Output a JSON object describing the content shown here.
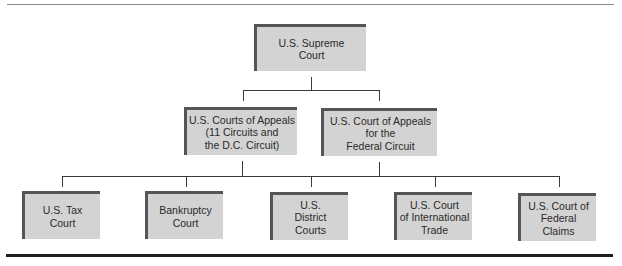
{
  "diagram": {
    "type": "hierarchy",
    "levels": [
      {
        "level": 1,
        "nodes": [
          {
            "id": "supreme",
            "label": "U.S. Supreme\nCourt"
          }
        ]
      },
      {
        "level": 2,
        "nodes": [
          {
            "id": "appeals",
            "label": "U.S. Courts of Appeals\n(11 Circuits and\nthe D.C. Circuit)",
            "parent": "supreme"
          },
          {
            "id": "federal_circuit",
            "label": "U.S. Court of Appeals\nfor the\nFederal Circuit",
            "parent": "supreme"
          }
        ]
      },
      {
        "level": 3,
        "nodes": [
          {
            "id": "tax",
            "label": "U.S. Tax\nCourt"
          },
          {
            "id": "bankruptcy",
            "label": "Bankruptcy\nCourt"
          },
          {
            "id": "district",
            "label": "U.S.\nDistrict\nCourts"
          },
          {
            "id": "intl_trade",
            "label": "U.S. Court\nof International\nTrade"
          },
          {
            "id": "federal_claims",
            "label": "U.S. Court of\nFederal\nClaims"
          }
        ]
      }
    ],
    "colors": {
      "box_fill": "#d3d3d3",
      "box_border": "#555555",
      "connector": "#3a3a3a",
      "rule": "#1e1e1e"
    }
  }
}
